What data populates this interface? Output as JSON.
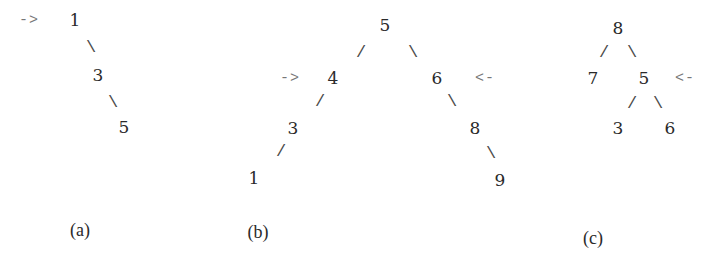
{
  "diagrams": [
    {
      "id": "a",
      "caption": "(a)",
      "caption_pos": [
        80,
        230
      ],
      "nodes": [
        {
          "label": "1",
          "pos": [
            75,
            20
          ]
        },
        {
          "label": "3",
          "pos": [
            98,
            75
          ]
        },
        {
          "label": "5",
          "pos": [
            124,
            127
          ]
        }
      ],
      "edges": [
        {
          "glyph": "\\",
          "from": "1",
          "to": "3",
          "pos": [
            91,
            47
          ]
        },
        {
          "glyph": "\\",
          "from": "3",
          "to": "5",
          "pos": [
            113,
            102
          ]
        }
      ],
      "markers": [
        {
          "glyph": "->",
          "points_to": "1",
          "pos": [
            29,
            20
          ]
        }
      ]
    },
    {
      "id": "b",
      "caption": "(b)",
      "caption_pos": [
        258,
        232
      ],
      "nodes": [
        {
          "label": "5",
          "pos": [
            385,
            25
          ]
        },
        {
          "label": "4",
          "pos": [
            333,
            78
          ]
        },
        {
          "label": "6",
          "pos": [
            437,
            78
          ]
        },
        {
          "label": "3",
          "pos": [
            293,
            128
          ]
        },
        {
          "label": "8",
          "pos": [
            475,
            128
          ]
        },
        {
          "label": "1",
          "pos": [
            254,
            178
          ]
        },
        {
          "label": "9",
          "pos": [
            500,
            180
          ]
        }
      ],
      "edges": [
        {
          "glyph": "/",
          "from": "5",
          "to": "4",
          "pos": [
            361,
            52
          ]
        },
        {
          "glyph": "\\",
          "from": "5",
          "to": "6",
          "pos": [
            413,
            52
          ]
        },
        {
          "glyph": "/",
          "from": "4",
          "to": "3",
          "pos": [
            320,
            101
          ]
        },
        {
          "glyph": "\\",
          "from": "6",
          "to": "8",
          "pos": [
            452,
            101
          ]
        },
        {
          "glyph": "/",
          "from": "3",
          "to": "1",
          "pos": [
            281,
            151
          ]
        },
        {
          "glyph": "\\",
          "from": "8",
          "to": "9",
          "pos": [
            491,
            153
          ]
        }
      ],
      "markers": [
        {
          "glyph": "->",
          "points_to": "4",
          "pos": [
            290,
            78
          ]
        },
        {
          "glyph": "<-",
          "points_to": "6",
          "pos": [
            485,
            78
          ]
        }
      ]
    },
    {
      "id": "c",
      "caption": "(c)",
      "caption_pos": [
        593,
        238
      ],
      "nodes": [
        {
          "label": "8",
          "pos": [
            618,
            28
          ]
        },
        {
          "label": "7",
          "pos": [
            593,
            78
          ]
        },
        {
          "label": "5",
          "pos": [
            644,
            78
          ]
        },
        {
          "label": "3",
          "pos": [
            618,
            128
          ]
        },
        {
          "label": "6",
          "pos": [
            670,
            128
          ]
        }
      ],
      "edges": [
        {
          "glyph": "/",
          "from": "8",
          "to": "7",
          "pos": [
            604,
            52
          ]
        },
        {
          "glyph": "\\",
          "from": "8",
          "to": "5",
          "pos": [
            632,
            52
          ]
        },
        {
          "glyph": "/",
          "from": "5",
          "to": "3",
          "pos": [
            632,
            103
          ]
        },
        {
          "glyph": "\\",
          "from": "5",
          "to": "6",
          "pos": [
            658,
            103
          ]
        }
      ],
      "markers": [
        {
          "glyph": "<-",
          "points_to": "5",
          "pos": [
            685,
            78
          ]
        }
      ]
    }
  ]
}
